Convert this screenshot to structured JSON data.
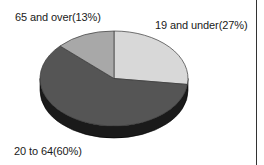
{
  "chart_data": {
    "type": "pie",
    "style": "3d",
    "title": "",
    "start_angle_deg": 0,
    "direction": "clockwise",
    "slices": [
      {
        "label": "19 and under",
        "value": 27,
        "display": "19 and under(27%)",
        "color": "#d8d8d8"
      },
      {
        "label": "20 to 64",
        "value": 60,
        "display": "20 to 64(60%)",
        "color": "#555555"
      },
      {
        "label": "65 and over",
        "value": 13,
        "display": "65 and over(13%)",
        "color": "#a8a8a8"
      }
    ],
    "side_color": "#1a1a1a",
    "legend": "none",
    "labels_position": "outside"
  },
  "labels": {
    "slice_19_under": "19 and under(27%)",
    "slice_20_64": "20 to 64(60%)",
    "slice_65_over": "65 and over(13%)"
  },
  "geometry": {
    "cx": 114,
    "cy": 78.5,
    "rx": 74,
    "ry": 47.5,
    "depth": 12
  }
}
